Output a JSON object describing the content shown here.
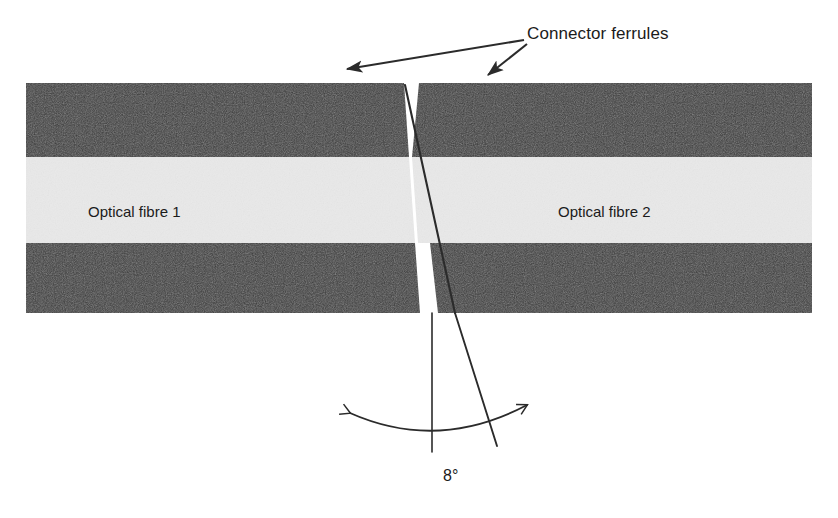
{
  "figure": {
    "background_color": "#ffffff"
  },
  "labels": {
    "connector_ferrules": "Connector ferrules",
    "fibre_left": "Optical fibre 1",
    "fibre_right": "Optical fibre 2",
    "angle": "8°"
  },
  "colors": {
    "ferrule_dark": "#3a3a3a",
    "fibre_core_light": "#e9e9e9",
    "line_dark": "#2b2b2b",
    "text": "#1b1b1b",
    "gap_white": "#ffffff"
  },
  "geometry": {
    "block_left_x": 26,
    "block_right_x": 812,
    "block_top_y": 83,
    "block_bottom_y": 313,
    "cladding_top_band": [
      83,
      157
    ],
    "core_band": [
      157,
      243
    ],
    "cladding_bottom_band": [
      243,
      313
    ],
    "cleave_top_x": 405,
    "cleave_bottom_x": 497,
    "gap_top_right_x": 419,
    "vertical_reference_x": 432,
    "arc_left_x": 350,
    "arc_right_x": 527,
    "arc_dip_y": 437,
    "angle_degrees": 8
  },
  "annotations": {
    "arrow_origin": {
      "x": 528,
      "y": 42
    },
    "arrow_left_tip": {
      "x": 344,
      "y": 70
    },
    "arrow_right_tip": {
      "x": 487,
      "y": 76
    }
  }
}
